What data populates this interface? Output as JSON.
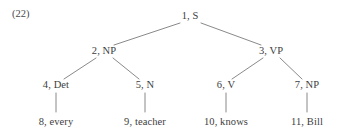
{
  "figure": {
    "example_number": "(22)",
    "type": "phrase-structure-tree",
    "sentence": "every teacher knows Bill"
  },
  "nodes": [
    {
      "id": "n1",
      "index": "1",
      "label": "S",
      "text": "1, S",
      "x": 190,
      "y": 16,
      "level": 0,
      "kind": "nonterminal"
    },
    {
      "id": "n2",
      "index": "2",
      "label": "NP",
      "text": "2, NP",
      "x": 104,
      "y": 51,
      "level": 1,
      "kind": "nonterminal"
    },
    {
      "id": "n3",
      "index": "3",
      "label": "VP",
      "text": "3, VP",
      "x": 271,
      "y": 51,
      "level": 1,
      "kind": "nonterminal"
    },
    {
      "id": "n4",
      "index": "4",
      "label": "Det",
      "text": "4, Det",
      "x": 56,
      "y": 85,
      "level": 2,
      "kind": "preterminal"
    },
    {
      "id": "n5",
      "index": "5",
      "label": "N",
      "text": "5, N",
      "x": 145,
      "y": 85,
      "level": 2,
      "kind": "preterminal"
    },
    {
      "id": "n6",
      "index": "6",
      "label": "V",
      "text": "6, V",
      "x": 226,
      "y": 85,
      "level": 2,
      "kind": "preterminal"
    },
    {
      "id": "n7",
      "index": "7",
      "label": "NP",
      "text": "7, NP",
      "x": 307,
      "y": 85,
      "level": 2,
      "kind": "preterminal"
    },
    {
      "id": "n8",
      "index": "8",
      "label": "every",
      "text": "8, every",
      "x": 56,
      "y": 122,
      "level": 3,
      "kind": "terminal"
    },
    {
      "id": "n9",
      "index": "9",
      "label": "teacher",
      "text": "9, teacher",
      "x": 145,
      "y": 122,
      "level": 3,
      "kind": "terminal"
    },
    {
      "id": "n10",
      "index": "10",
      "label": "knows",
      "text": "10, knows",
      "x": 226,
      "y": 122,
      "level": 3,
      "kind": "terminal"
    },
    {
      "id": "n11",
      "index": "11",
      "label": "Bill",
      "text": "11, Bill",
      "x": 307,
      "y": 122,
      "level": 3,
      "kind": "terminal"
    }
  ],
  "edges": [
    {
      "from": "n1",
      "to": "n2",
      "x1": 180,
      "y1": 23,
      "x2": 114,
      "y2": 45
    },
    {
      "from": "n1",
      "to": "n3",
      "x1": 201,
      "y1": 23,
      "x2": 261,
      "y2": 45
    },
    {
      "from": "n2",
      "to": "n4",
      "x1": 96,
      "y1": 58,
      "x2": 64,
      "y2": 79
    },
    {
      "from": "n2",
      "to": "n5",
      "x1": 113,
      "y1": 58,
      "x2": 139,
      "y2": 79
    },
    {
      "from": "n3",
      "to": "n6",
      "x1": 263,
      "y1": 58,
      "x2": 232,
      "y2": 79
    },
    {
      "from": "n3",
      "to": "n7",
      "x1": 280,
      "y1": 58,
      "x2": 302,
      "y2": 79
    },
    {
      "from": "n4",
      "to": "n8",
      "x1": 56,
      "y1": 93,
      "x2": 56,
      "y2": 112
    },
    {
      "from": "n5",
      "to": "n9",
      "x1": 145,
      "y1": 93,
      "x2": 145,
      "y2": 112
    },
    {
      "from": "n6",
      "to": "n10",
      "x1": 226,
      "y1": 93,
      "x2": 226,
      "y2": 112
    },
    {
      "from": "n7",
      "to": "n11",
      "x1": 307,
      "y1": 93,
      "x2": 307,
      "y2": 112
    }
  ],
  "colors": {
    "background": "#ffffff",
    "text": "#3d3d3d",
    "edge": "#7c7c7c"
  }
}
